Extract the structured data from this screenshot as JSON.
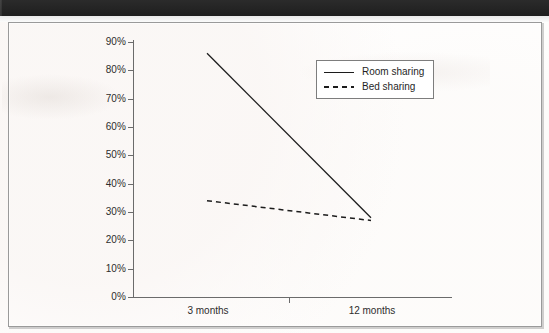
{
  "document": {
    "top_band_label": "",
    "page_background": "#ffffff",
    "frame_color": "#9a9a9a"
  },
  "chart_data": {
    "type": "line",
    "title": "",
    "subtitle": "",
    "xlabel": "",
    "ylabel": "",
    "categories": [
      "3 months",
      "12 months"
    ],
    "series": [
      {
        "name": "Room sharing",
        "values": [
          86,
          28
        ],
        "style": "solid",
        "color": "#1c1c1c"
      },
      {
        "name": "Bed sharing",
        "values": [
          34,
          27
        ],
        "style": "dashed",
        "color": "#1c1c1c"
      }
    ],
    "ylim": [
      0,
      90
    ],
    "ytick_values": [
      0,
      10,
      20,
      30,
      40,
      50,
      60,
      70,
      80,
      90
    ],
    "ytick_labels": [
      "0%",
      "10%",
      "20%",
      "30%",
      "40%",
      "50%",
      "60%",
      "70%",
      "80%",
      "90%"
    ],
    "grid": false,
    "legend_position": "upper-right",
    "legend_entries": [
      "Room sharing",
      "Bed sharing"
    ]
  },
  "legend": {
    "entries": [
      {
        "label": "Room sharing",
        "style": "solid"
      },
      {
        "label": "Bed sharing",
        "style": "dashed"
      }
    ]
  },
  "axes": {
    "y_labels": [
      "90%",
      "80%",
      "70%",
      "60%",
      "50%",
      "40%",
      "30%",
      "20%",
      "10%",
      "0%"
    ],
    "x_labels": [
      "3 months",
      "12 months"
    ]
  }
}
